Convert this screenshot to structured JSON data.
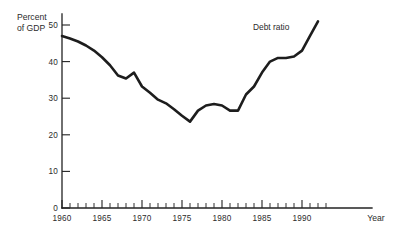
{
  "chart_data": {
    "type": "line",
    "title": "",
    "subtitle": "",
    "xlabel": "Year",
    "ylabel": "Percent of GDP",
    "ylabel_line1": "Percent",
    "ylabel_line2": "of GDP",
    "xlim": [
      1960,
      1993
    ],
    "ylim": [
      0,
      52
    ],
    "grid": false,
    "legend_position": "inline-annotation",
    "y_ticks": [
      0,
      10,
      20,
      30,
      40,
      50
    ],
    "y_tick_labels": [
      "0",
      "10",
      "20",
      "30",
      "40",
      "50"
    ],
    "x_ticks": [
      1960,
      1965,
      1970,
      1975,
      1980,
      1985,
      1990
    ],
    "x_tick_labels": [
      "1960",
      "1965",
      "1970",
      "1975",
      "1980",
      "1985",
      "1990"
    ],
    "x_minor_tick_step": 1,
    "annotations": [
      {
        "text": "Debt ratio",
        "x": 1989.5,
        "y": 48.5
      }
    ],
    "series": [
      {
        "name": "Debt ratio",
        "color": "#1d1d1d",
        "x": [
          1960,
          1961,
          1962,
          1963,
          1964,
          1965,
          1966,
          1967,
          1968,
          1969,
          1970,
          1971,
          1972,
          1973,
          1974,
          1975,
          1976,
          1977,
          1978,
          1979,
          1980,
          1981,
          1982,
          1983,
          1984,
          1985,
          1986,
          1987,
          1988,
          1989,
          1990,
          1991,
          1992
        ],
        "values": [
          47.0,
          46.3,
          45.5,
          44.4,
          43.0,
          41.2,
          39.0,
          36.2,
          35.4,
          37.0,
          33.2,
          31.5,
          29.6,
          28.6,
          27.0,
          25.2,
          23.6,
          26.6,
          28.0,
          28.4,
          28.0,
          26.6,
          26.6,
          31.0,
          33.2,
          37.0,
          40.0,
          41.0,
          41.0,
          41.4,
          43.0,
          47.0,
          51.0
        ]
      }
    ]
  },
  "figure": {
    "background_color": "#ffffff",
    "axis_color": "#222222",
    "text_color": "#2b2b2b"
  }
}
